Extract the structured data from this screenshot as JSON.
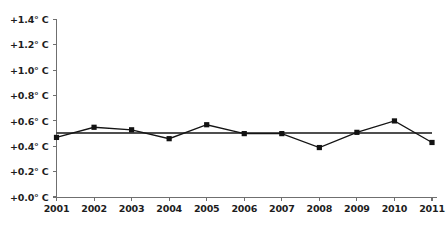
{
  "chart_data": {
    "type": "line",
    "title": "",
    "subtitle": "",
    "xlabel": "",
    "ylabel": "",
    "categories": [
      "2001",
      "2002",
      "2003",
      "2004",
      "2005",
      "2006",
      "2007",
      "2008",
      "2009",
      "2010",
      "2011"
    ],
    "x": [
      2001,
      2002,
      2003,
      2004,
      2005,
      2006,
      2007,
      2008,
      2009,
      2010,
      2011
    ],
    "series": [
      {
        "name": "Temperature anomaly",
        "values": [
          0.47,
          0.55,
          0.53,
          0.46,
          0.57,
          0.5,
          0.5,
          0.39,
          0.51,
          0.6,
          0.43
        ],
        "marker": "square",
        "color": "#121212"
      },
      {
        "name": "Trend line",
        "values": [
          0.505,
          0.505,
          0.505,
          0.505,
          0.505,
          0.505,
          0.505,
          0.505,
          0.505,
          0.505,
          0.505
        ],
        "marker": "none",
        "color": "#141414"
      }
    ],
    "ylim": [
      0.0,
      1.4
    ],
    "xlim": [
      2001,
      2011
    ],
    "yticks": [
      0.0,
      0.2,
      0.4,
      0.6,
      0.8,
      1.0,
      1.2,
      1.4
    ],
    "ytick_labels": [
      "+0.0° C",
      "+0.2° C",
      "+0.4° C",
      "+0.6° C",
      "+0.8° C",
      "+1.0° C",
      "+1.2° C",
      "+1.4° C"
    ],
    "xtick_labels": [
      "2001",
      "2002",
      "2003",
      "2004",
      "2005",
      "2006",
      "2007",
      "2008",
      "2009",
      "2010",
      "2011"
    ],
    "grid": false,
    "legend": "none",
    "annotations": [],
    "units": "degrees Celsius anomaly",
    "colors": {
      "background": "#ffffff",
      "axis": "#6f6f6f",
      "line": "#141414",
      "marker": "#121212",
      "text": "#1d1d1d"
    }
  }
}
